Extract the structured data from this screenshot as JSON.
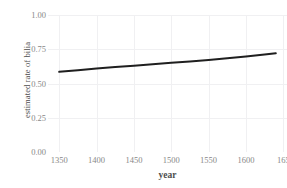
{
  "chart_data": {
    "type": "line",
    "title": "",
    "subtitle": "",
    "xlabel": "year",
    "ylabel": "estimated rate of bilia",
    "xlim": [
      1335,
      1655
    ],
    "ylim": [
      0.0,
      1.0
    ],
    "grid": true,
    "legend": null,
    "x_ticks": [
      1350,
      1400,
      1450,
      1500,
      1550,
      1600,
      1650
    ],
    "x_tick_labels": [
      "1350",
      "1400",
      "1450",
      "1500",
      "1550",
      "1600",
      "165"
    ],
    "y_ticks": [
      0.0,
      0.25,
      0.5,
      0.75,
      1.0
    ],
    "y_tick_labels": [
      "0.00",
      "0.25",
      "0.50",
      "0.75",
      "1.00"
    ],
    "series": [
      {
        "name": "estimated rate",
        "color": "#1f1f1f",
        "line_width": 2.0,
        "x": [
          1350,
          1375,
          1400,
          1425,
          1450,
          1475,
          1500,
          1525,
          1550,
          1575,
          1600,
          1625,
          1640
        ],
        "y": [
          0.585,
          0.597,
          0.609,
          0.62,
          0.63,
          0.64,
          0.651,
          0.661,
          0.672,
          0.684,
          0.697,
          0.712,
          0.72
        ]
      }
    ],
    "annotations": []
  },
  "style": {
    "background": "#ffffff",
    "panel_background": "#ffffff",
    "grid_color": "#f0f0f2",
    "tick_label_color": "#888888",
    "axis_title_color": "#4d4d4d",
    "series_color": "#1f1f1f"
  }
}
